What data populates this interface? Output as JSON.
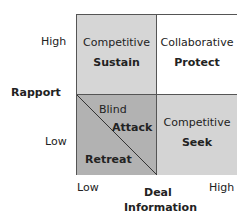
{
  "colors": {
    "competitive_sustain": "#d6d6d6",
    "collaborative_protect": "#ffffff",
    "blind_attack_retreat": "#b2b2b2",
    "competitive_seek": "#d4d4d4",
    "border": "#555555"
  },
  "quadrants": {
    "top_left": {
      "style": "Competitive",
      "strategy": "Sustain"
    },
    "top_right": {
      "style": "Collaborative",
      "strategy": "Protect"
    },
    "bottom_left": {
      "upper": "Blind",
      "upper_strategy": "Attack",
      "lower_strategy": "Retreat"
    },
    "bottom_right": {
      "style": "Competitive",
      "strategy": "Seek"
    }
  },
  "y_axis": {
    "title": "Rapport",
    "high": "High",
    "low": "Low"
  },
  "x_axis": {
    "title_line1": "Deal",
    "title_line2": "Information",
    "low": "Low",
    "high": "High"
  }
}
